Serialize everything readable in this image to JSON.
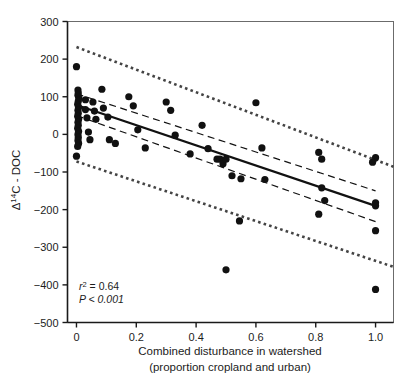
{
  "figure": {
    "background_color": "#ffffff",
    "ink_color": "#1a1a1a"
  },
  "chart_data": {
    "type": "scatter",
    "title": "",
    "subtitle": "",
    "xlabel": "Combined disturbance in watershed",
    "xlabel_line2": "(proportion cropland and urban)",
    "ylabel": "Δ14C - DOC",
    "ylabel_delta": "Δ",
    "ylabel_superscript": "14",
    "ylabel_rest": "C - DOC",
    "xlim": [
      -0.03,
      1.06
    ],
    "ylim": [
      -500,
      300
    ],
    "xticks": [
      0,
      0.2,
      0.4,
      0.6,
      0.8,
      1.0
    ],
    "xtick_labels": [
      "0",
      "0.2",
      "0.4",
      "0.6",
      "0.8",
      "1.0"
    ],
    "yticks": [
      300,
      200,
      100,
      0,
      -100,
      -200,
      -300,
      -400,
      -500
    ],
    "ytick_labels": [
      "300",
      "200",
      "100",
      "0",
      "−100",
      "−200",
      "−300",
      "−400",
      "−500"
    ],
    "grid": false,
    "legend": false,
    "legend_position": "none",
    "marker": "filled-circle",
    "marker_color": "#111111",
    "marker_size_px": 5.4,
    "points": [
      {
        "x": 0.0,
        "y": 180
      },
      {
        "x": 0.005,
        "y": 118
      },
      {
        "x": 0.005,
        "y": 104
      },
      {
        "x": 0.008,
        "y": 96
      },
      {
        "x": 0.006,
        "y": 88
      },
      {
        "x": 0.004,
        "y": 80
      },
      {
        "x": 0.007,
        "y": 72
      },
      {
        "x": 0.005,
        "y": 64
      },
      {
        "x": 0.006,
        "y": 56
      },
      {
        "x": 0.004,
        "y": 48
      },
      {
        "x": 0.007,
        "y": 40
      },
      {
        "x": 0.005,
        "y": 32
      },
      {
        "x": 0.006,
        "y": 24
      },
      {
        "x": 0.004,
        "y": 16
      },
      {
        "x": 0.007,
        "y": 8
      },
      {
        "x": 0.005,
        "y": 0
      },
      {
        "x": 0.006,
        "y": -8
      },
      {
        "x": 0.005,
        "y": -16
      },
      {
        "x": 0.007,
        "y": -24
      },
      {
        "x": 0.004,
        "y": -32
      },
      {
        "x": 0.006,
        "y": 110
      },
      {
        "x": 0.03,
        "y": 92
      },
      {
        "x": 0.03,
        "y": 66
      },
      {
        "x": 0.035,
        "y": 44
      },
      {
        "x": 0.04,
        "y": 6
      },
      {
        "x": 0.045,
        "y": -14
      },
      {
        "x": 0.055,
        "y": 86
      },
      {
        "x": 0.06,
        "y": 62
      },
      {
        "x": 0.065,
        "y": 40
      },
      {
        "x": 0.0,
        "y": -58
      },
      {
        "x": 0.085,
        "y": 120
      },
      {
        "x": 0.09,
        "y": 70
      },
      {
        "x": 0.105,
        "y": 46
      },
      {
        "x": 0.11,
        "y": -14
      },
      {
        "x": 0.13,
        "y": -24
      },
      {
        "x": 0.175,
        "y": 100
      },
      {
        "x": 0.19,
        "y": 76
      },
      {
        "x": 0.205,
        "y": 12
      },
      {
        "x": 0.23,
        "y": -36
      },
      {
        "x": 0.3,
        "y": 86
      },
      {
        "x": 0.315,
        "y": 64
      },
      {
        "x": 0.33,
        "y": -2
      },
      {
        "x": 0.38,
        "y": -52
      },
      {
        "x": 0.42,
        "y": 24
      },
      {
        "x": 0.44,
        "y": -38
      },
      {
        "x": 0.47,
        "y": -66
      },
      {
        "x": 0.48,
        "y": -66
      },
      {
        "x": 0.49,
        "y": -78
      },
      {
        "x": 0.5,
        "y": -66
      },
      {
        "x": 0.5,
        "y": -360
      },
      {
        "x": 0.52,
        "y": -110
      },
      {
        "x": 0.55,
        "y": -118
      },
      {
        "x": 0.6,
        "y": 84
      },
      {
        "x": 0.62,
        "y": -36
      },
      {
        "x": 0.63,
        "y": -120
      },
      {
        "x": 0.545,
        "y": -230
      },
      {
        "x": 0.81,
        "y": -48
      },
      {
        "x": 0.82,
        "y": -66
      },
      {
        "x": 0.82,
        "y": -142
      },
      {
        "x": 0.83,
        "y": -176
      },
      {
        "x": 0.81,
        "y": -212
      },
      {
        "x": 1.0,
        "y": -62
      },
      {
        "x": 1.0,
        "y": -182
      },
      {
        "x": 1.0,
        "y": -190
      },
      {
        "x": 1.0,
        "y": -256
      },
      {
        "x": 1.0,
        "y": -412
      },
      {
        "x": 0.99,
        "y": -74
      }
    ],
    "regression_line": {
      "style": "solid",
      "color": "#111111",
      "width_px": 2.2,
      "x0": 0.0,
      "y0": 78,
      "x1": 1.0,
      "y1": -190,
      "slope": -268,
      "intercept": 78
    },
    "confidence_band": {
      "style": "dashed",
      "label": "95% confidence interval",
      "color": "#111111",
      "upper": {
        "x0": 0.0,
        "y0": 108,
        "x1": 1.0,
        "y1": -150
      },
      "lower": {
        "x0": 0.0,
        "y0": 50,
        "x1": 1.0,
        "y1": -232
      }
    },
    "prediction_band": {
      "style": "dotted",
      "label": "95% prediction interval",
      "color": "#444444",
      "upper": {
        "x0": 0.0,
        "y0": 232,
        "x1": 1.06,
        "y1": -86
      },
      "lower": {
        "x0": 0.0,
        "y0": -72,
        "x1": 1.06,
        "y1": -352
      }
    },
    "annotations": [
      {
        "name": "r-squared",
        "text": "r2 = 0.64",
        "symbol": "r",
        "superscript": "2",
        "value_text": " = 0.64",
        "x": 0.03,
        "y": -425
      },
      {
        "name": "p-value",
        "text": "P < 0.001",
        "symbol": "P",
        "value_text": " < 0.001",
        "x": 0.03,
        "y": -465
      }
    ]
  },
  "stats": {
    "r_symbol": "r",
    "r_sup": "2",
    "r_value": " = 0.64",
    "p_text": "P < 0.001"
  }
}
